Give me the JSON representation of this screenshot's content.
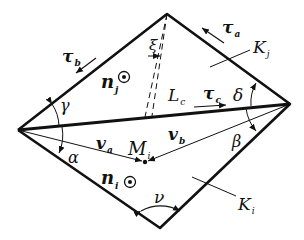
{
  "figure": {
    "colors": {
      "stroke": "#111111",
      "background": "#ffffff"
    },
    "vertices": {
      "left": [
        18,
        130
      ],
      "right": [
        290,
        104
      ],
      "top": [
        167,
        14
      ],
      "bottom": [
        160,
        228
      ],
      "midpoint_Mi": [
        145,
        162
      ]
    },
    "labels": {
      "tau_a": {
        "main": "τ",
        "sub": "a"
      },
      "tau_b": {
        "main": "τ",
        "sub": "b"
      },
      "tau_c": {
        "main": "τ",
        "sub": "c"
      },
      "K_j": {
        "main": "K",
        "sub": "j"
      },
      "K_i": {
        "main": "K",
        "sub": "i"
      },
      "n_j": {
        "main": "n",
        "sub": "j"
      },
      "n_i": {
        "main": "n",
        "sub": "i"
      },
      "L_c": {
        "main": "L",
        "sub": "c"
      },
      "v_a": {
        "main": "v",
        "sub": "a"
      },
      "v_b": {
        "main": "v",
        "sub": "b"
      },
      "M_i": {
        "main": "M",
        "sub": "i"
      },
      "xi": "ξ",
      "gamma": "γ",
      "delta": "δ",
      "alpha": "α",
      "beta": "β",
      "nu": "ν",
      "out_of_plane_symbol": "⊙"
    }
  }
}
